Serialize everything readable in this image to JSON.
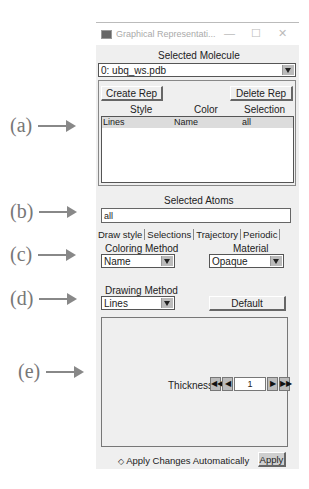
{
  "annotations": {
    "a": "(a)",
    "b": "(b)",
    "c": "(c)",
    "d": "(d)",
    "e": "(e)"
  },
  "window": {
    "title": "Graphical Representati...",
    "minimize": "—",
    "maximize": "☐",
    "close": "✕"
  },
  "molecule": {
    "label": "Selected Molecule",
    "value": "0: ubq_ws.pdb"
  },
  "reps": {
    "create_label": "Create Rep",
    "delete_label": "Delete Rep",
    "columns": [
      "Style",
      "Color",
      "Selection"
    ],
    "rows": [
      {
        "style": "Lines",
        "color": "Name",
        "selection": "all"
      }
    ]
  },
  "atoms": {
    "label": "Selected Atoms",
    "value": "all"
  },
  "tabs": [
    "Draw style",
    "Selections",
    "Trajectory",
    "Periodic"
  ],
  "coloring": {
    "label": "Coloring Method",
    "value": "Name"
  },
  "material": {
    "label": "Material",
    "value": "Opaque"
  },
  "drawing": {
    "label": "Drawing Method",
    "value": "Lines",
    "default_label": "Default"
  },
  "thickness": {
    "label": "Thickness",
    "value": "1",
    "first": "◀◀",
    "prev": "◀",
    "next": "▶",
    "last": "▶▶"
  },
  "footer": {
    "auto_label": "Apply Changes Automatically",
    "apply_label": "Apply"
  }
}
